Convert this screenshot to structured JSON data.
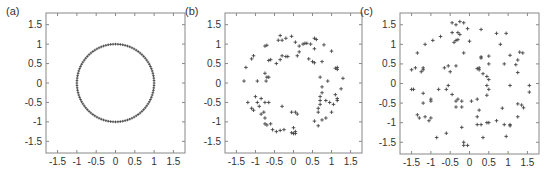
{
  "figure": {
    "axis_range": [
      -1.8,
      1.8
    ],
    "ticks": [
      -1.5,
      -1,
      -0.5,
      0,
      0.5,
      1,
      1.5
    ],
    "tick_labels": [
      "-1.5",
      "-1",
      "-0.5",
      "0",
      "0.5",
      "1",
      "1.5"
    ],
    "marker": "+",
    "marker_color": "#444444",
    "axis_color": "#888888"
  },
  "chart_data": [
    {
      "type": "scatter",
      "label": "(a)",
      "title": "",
      "xlabel": "",
      "ylabel": "",
      "xlim": [
        -1.8,
        1.8
      ],
      "ylim": [
        -1.8,
        1.8
      ],
      "grid": false,
      "description": "Points evenly spaced on the unit circle",
      "generated": {
        "kind": "circle",
        "radius": 1,
        "count": 100
      }
    },
    {
      "type": "scatter",
      "label": "(b)",
      "title": "",
      "xlabel": "",
      "ylabel": "",
      "xlim": [
        -1.8,
        1.8
      ],
      "ylim": [
        -1.8,
        1.8
      ],
      "grid": false,
      "points": [
        [
          -1.3,
          0.05
        ],
        [
          -1.25,
          0.4
        ],
        [
          -1.1,
          0.62
        ],
        [
          -1.05,
          0.7
        ],
        [
          -0.95,
          0.05
        ],
        [
          -0.75,
          0.95
        ],
        [
          -0.7,
          0.97
        ],
        [
          -0.75,
          0.25
        ],
        [
          -0.7,
          0.15
        ],
        [
          -0.72,
          0.05
        ],
        [
          -0.65,
          0.15
        ],
        [
          -0.65,
          0.58
        ],
        [
          -0.6,
          0.6
        ],
        [
          -0.45,
          0.5
        ],
        [
          -0.35,
          0.6
        ],
        [
          -0.3,
          0.7
        ],
        [
          -0.2,
          0.68
        ],
        [
          -0.15,
          0.68
        ],
        [
          -0.4,
          1.1
        ],
        [
          -0.3,
          1.1
        ],
        [
          -0.35,
          1.22
        ],
        [
          -0.2,
          1.15
        ],
        [
          -0.05,
          1.2
        ],
        [
          0.05,
          1.05
        ],
        [
          0.1,
          0.7
        ],
        [
          0.15,
          0.8
        ],
        [
          0.15,
          0.95
        ],
        [
          0.25,
          1.0
        ],
        [
          0.3,
          1.02
        ],
        [
          0.35,
          1.02
        ],
        [
          0.45,
          1.0
        ],
        [
          0.55,
          1.15
        ],
        [
          0.6,
          1.12
        ],
        [
          0.55,
          0.88
        ],
        [
          0.4,
          0.62
        ],
        [
          0.5,
          0.55
        ],
        [
          0.55,
          0.52
        ],
        [
          0.75,
          0.55
        ],
        [
          0.8,
          0.98
        ],
        [
          1.0,
          0.82
        ],
        [
          1.1,
          0.38
        ],
        [
          1.15,
          0.35
        ],
        [
          1.15,
          0.4
        ],
        [
          1.3,
          0.12
        ],
        [
          1.25,
          -0.15
        ],
        [
          0.7,
          0.15
        ],
        [
          0.9,
          0.05
        ],
        [
          0.75,
          -0.1
        ],
        [
          0.75,
          -0.25
        ],
        [
          0.7,
          -0.35
        ],
        [
          0.7,
          -0.45
        ],
        [
          0.7,
          -0.55
        ],
        [
          0.65,
          -0.65
        ],
        [
          0.65,
          -0.75
        ],
        [
          0.85,
          -0.45
        ],
        [
          0.95,
          -0.5
        ],
        [
          1.05,
          -0.55
        ],
        [
          1.1,
          -0.3
        ],
        [
          1.15,
          -0.4
        ],
        [
          1.15,
          -0.45
        ],
        [
          1.0,
          -0.75
        ],
        [
          0.85,
          -0.9
        ],
        [
          0.75,
          -0.95
        ],
        [
          0.55,
          -0.98
        ],
        [
          0.65,
          -1.1
        ],
        [
          -1.2,
          -0.5
        ],
        [
          -1.1,
          -0.65
        ],
        [
          -1.05,
          -0.7
        ],
        [
          -1.0,
          -0.35
        ],
        [
          -0.95,
          -0.5
        ],
        [
          -0.9,
          -0.6
        ],
        [
          -0.85,
          -0.4
        ],
        [
          -0.85,
          -0.8
        ],
        [
          -0.78,
          -0.75
        ],
        [
          -0.75,
          -0.5
        ],
        [
          -0.65,
          -0.5
        ],
        [
          -0.75,
          -0.9
        ],
        [
          -0.75,
          -1.05
        ],
        [
          -0.7,
          -1.08
        ],
        [
          -0.6,
          -1.05
        ],
        [
          -0.55,
          -1.2
        ],
        [
          -0.45,
          -1.25
        ],
        [
          -0.35,
          -1.22
        ],
        [
          -0.25,
          -1.2
        ],
        [
          -0.3,
          -0.6
        ],
        [
          -0.05,
          -0.75
        ],
        [
          0.05,
          -0.75
        ],
        [
          0.1,
          -0.8
        ],
        [
          0.0,
          -1.15
        ],
        [
          0.0,
          -1.3
        ],
        [
          0.05,
          -1.25
        ],
        [
          0.05,
          -1.3
        ],
        [
          -0.05,
          -1.28
        ]
      ]
    },
    {
      "type": "scatter",
      "label": "(c)",
      "title": "",
      "xlabel": "",
      "ylabel": "",
      "xlim": [
        -1.8,
        1.8
      ],
      "ylim": [
        -1.8,
        1.8
      ],
      "grid": false,
      "points": [
        [
          -1.5,
          0.35
        ],
        [
          -1.4,
          0.4
        ],
        [
          -1.35,
          0.78
        ],
        [
          -1.15,
          1.0
        ],
        [
          -1.2,
          0.35
        ],
        [
          -1.2,
          0.4
        ],
        [
          -1.25,
          0.3
        ],
        [
          -0.95,
          1.1
        ],
        [
          -0.75,
          1.2
        ],
        [
          -0.65,
          0.4
        ],
        [
          -0.55,
          0.45
        ],
        [
          -0.5,
          0.3
        ],
        [
          -0.35,
          0.45
        ],
        [
          -0.45,
          1.55
        ],
        [
          -0.35,
          1.5
        ],
        [
          -0.25,
          1.58
        ],
        [
          -0.15,
          1.55
        ],
        [
          -0.45,
          1.3
        ],
        [
          -0.3,
          1.3
        ],
        [
          -0.25,
          1.25
        ],
        [
          -0.3,
          1.12
        ],
        [
          -0.35,
          1.1
        ],
        [
          -0.4,
          1.05
        ],
        [
          -0.05,
          1.4
        ],
        [
          0.0,
          1.08
        ],
        [
          -0.15,
          0.78
        ],
        [
          0.3,
          1.38
        ],
        [
          0.7,
          1.28
        ],
        [
          0.95,
          1.28
        ],
        [
          0.8,
          1.0
        ],
        [
          0.3,
          0.68
        ],
        [
          0.3,
          0.65
        ],
        [
          0.5,
          0.7
        ],
        [
          0.5,
          0.5
        ],
        [
          0.25,
          0.4
        ],
        [
          0.2,
          0.38
        ],
        [
          0.25,
          0.35
        ],
        [
          0.35,
          0.25
        ],
        [
          0.45,
          0.18
        ],
        [
          0.5,
          0.1
        ],
        [
          0.9,
          0.5
        ],
        [
          1.05,
          0.72
        ],
        [
          1.3,
          0.8
        ],
        [
          1.38,
          0.78
        ],
        [
          1.25,
          0.6
        ],
        [
          1.2,
          0.48
        ],
        [
          1.25,
          0.28
        ],
        [
          1.55,
          -0.05
        ],
        [
          1.55,
          -0.22
        ],
        [
          1.05,
          -0.05
        ],
        [
          -1.5,
          -0.15
        ],
        [
          -1.45,
          -0.15
        ],
        [
          -1.2,
          -0.25
        ],
        [
          -1.2,
          -0.5
        ],
        [
          -1.0,
          -0.4
        ],
        [
          -1.0,
          -0.45
        ],
        [
          -0.8,
          -0.15
        ],
        [
          -0.6,
          -0.15
        ],
        [
          -0.55,
          -0.05
        ],
        [
          -0.45,
          -0.28
        ],
        [
          -0.35,
          -0.45
        ],
        [
          -0.3,
          -0.4
        ],
        [
          -0.2,
          -0.45
        ],
        [
          -0.35,
          -0.6
        ],
        [
          -0.2,
          -0.6
        ],
        [
          0.05,
          -0.45
        ],
        [
          0.2,
          -0.4
        ],
        [
          0.25,
          -0.68
        ],
        [
          0.2,
          -0.85
        ],
        [
          0.45,
          -0.05
        ],
        [
          0.5,
          -0.15
        ],
        [
          0.45,
          -0.3
        ],
        [
          0.85,
          -0.63
        ],
        [
          1.25,
          -0.52
        ],
        [
          1.35,
          -0.55
        ],
        [
          1.4,
          -0.62
        ],
        [
          1.25,
          -0.85
        ],
        [
          -1.35,
          -0.8
        ],
        [
          -1.3,
          -0.88
        ],
        [
          -1.15,
          -0.85
        ],
        [
          -1.05,
          -0.95
        ],
        [
          -1.0,
          -0.88
        ],
        [
          -0.85,
          -1.38
        ],
        [
          -0.6,
          -1.27
        ],
        [
          -0.2,
          -1.12
        ],
        [
          0.2,
          -1.05
        ],
        [
          0.3,
          -1.05
        ],
        [
          0.45,
          -1.0
        ],
        [
          0.5,
          -1.0
        ],
        [
          0.7,
          -0.95
        ],
        [
          0.9,
          -1.05
        ],
        [
          1.05,
          -1.05
        ],
        [
          1.05,
          -1.08
        ],
        [
          0.35,
          -1.38
        ],
        [
          0.95,
          -1.35
        ],
        [
          -0.15,
          -1.5
        ],
        [
          -0.15,
          -1.58
        ],
        [
          -0.05,
          -1.58
        ]
      ]
    }
  ]
}
